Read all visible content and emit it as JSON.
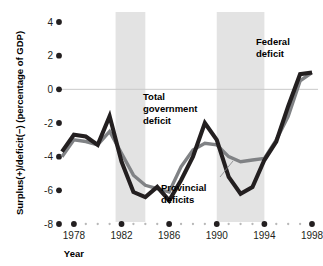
{
  "chart_data": {
    "type": "line",
    "title": "",
    "xlabel": "Year",
    "ylabel": "Surplus(+)/deficit(−) (percentage of GDP)",
    "xlim": [
      1977,
      1998
    ],
    "ylim": [
      -8,
      4
    ],
    "yticks": [
      4,
      2,
      0,
      -2,
      -4,
      -6,
      -8
    ],
    "ytick_labels": [
      "4",
      "2",
      "0",
      "-2",
      "-4",
      "-6",
      "-8"
    ],
    "xticks": [
      1978,
      1982,
      1986,
      1990,
      1994,
      1998
    ],
    "xtick_labels": [
      "1978",
      "1982",
      "1986",
      "1990",
      "1994",
      "1998"
    ],
    "x_minor_ticks": [
      1979,
      1980,
      1981,
      1983,
      1984,
      1985,
      1987,
      1988,
      1989,
      1991,
      1992,
      1993,
      1995,
      1996,
      1997
    ],
    "grid": false,
    "zero_line": true,
    "legend_position": "inline-annotations",
    "x": [
      1977,
      1978,
      1979,
      1980,
      1981,
      1982,
      1983,
      1984,
      1985,
      1986,
      1987,
      1988,
      1989,
      1990,
      1991,
      1992,
      1993,
      1994,
      1995,
      1996,
      1997,
      1998
    ],
    "series": [
      {
        "name": "Total government deficit",
        "color": "#231f20",
        "values": [
          -3.7,
          -2.7,
          -2.8,
          -3.3,
          -1.6,
          -4.3,
          -6.1,
          -6.4,
          -5.8,
          -6.6,
          -5.4,
          -4.0,
          -2.0,
          -3.0,
          -5.2,
          -6.2,
          -5.8,
          -4.2,
          -3.1,
          -1.0,
          0.9,
          1.0
        ]
      },
      {
        "name": "Provincial deficits",
        "color": "#808285",
        "values": [
          -4.0,
          -3.0,
          -3.1,
          -3.3,
          -2.5,
          -3.8,
          -5.1,
          -5.7,
          -5.9,
          -6.1,
          -4.6,
          -3.6,
          -3.2,
          -3.3,
          -4.0,
          -4.3,
          -4.2,
          -4.1,
          -3.0,
          -1.6,
          0.5,
          1.0
        ]
      }
    ],
    "shaded_bands": [
      {
        "start": 1981.5,
        "end": 1984.0
      },
      {
        "start": 1990.0,
        "end": 1994.0
      }
    ],
    "band_color": "#e3e3e3",
    "annotations": [
      {
        "id": "total-government-deficit",
        "text_lines": [
          "Total",
          "government",
          "deficit"
        ],
        "x": 143,
        "y": 100,
        "anchor": "start"
      },
      {
        "id": "federal-deficit",
        "text_lines": [
          "Federal",
          "deficit"
        ],
        "x": 256,
        "y": 45,
        "anchor": "start"
      },
      {
        "id": "provincial-deficits",
        "text_lines": [
          "Provincial",
          "deficits"
        ],
        "x": 161,
        "y": 191,
        "anchor": "start"
      }
    ],
    "leader_line": {
      "x1": 220,
      "y1": 177,
      "x2": 233,
      "y2": 161,
      "color": "#808285"
    }
  }
}
